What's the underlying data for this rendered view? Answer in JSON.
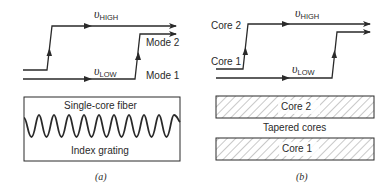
{
  "panel_a": {
    "v_high": {
      "symbol": "υ",
      "sub": "HIGH"
    },
    "v_low": {
      "symbol": "υ",
      "sub": "LOW"
    },
    "mode2_label": "Mode 2",
    "mode1_label": "Mode 1",
    "box_top_label": "Single-core fiber",
    "box_bottom_label": "Index grating",
    "caption": "(a)"
  },
  "panel_b": {
    "v_high": {
      "symbol": "υ",
      "sub": "HIGH"
    },
    "v_low": {
      "symbol": "υ",
      "sub": "LOW"
    },
    "core2_path_label": "Core 2",
    "core1_path_label": "Core 1",
    "core2_box_label": "Core 2",
    "middle_label": "Tapered cores",
    "core1_box_label": "Core 1",
    "caption": "(b)"
  },
  "colors": {
    "line": "#2a2a2a",
    "hatch": "#6a6a6a"
  }
}
